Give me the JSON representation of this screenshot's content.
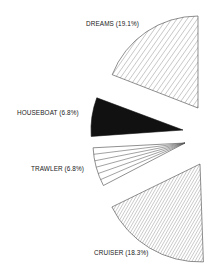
{
  "chart_data": {
    "type": "pie",
    "style": "exploded partial pie (wedges only, pulled apart)",
    "title": "",
    "slices": [
      {
        "label": "DREAMS",
        "value": 19.1,
        "display": "DREAMS (19.1%)",
        "fill": "diagonal-hatch-wide"
      },
      {
        "label": "HOUSEBOAT",
        "value": 6.8,
        "display": "HOUSEBOAT (6.8%)",
        "fill": "solid-black"
      },
      {
        "label": "TRAWLER",
        "value": 6.8,
        "display": "TRAWLER (6.8%)",
        "fill": "horizontal-lines"
      },
      {
        "label": "CRUISER",
        "value": 18.3,
        "display": "CRUISER (18.3%)",
        "fill": "diagonal-hatch-dense"
      }
    ],
    "units": "%",
    "legend": "none (inline labels)"
  },
  "colors": {
    "ink": "#1a1a1a",
    "hatch": "#555555",
    "background": "#ffffff"
  },
  "geometry": {
    "wedges": [
      {
        "name": "dreams",
        "cx": 198,
        "cy": 108,
        "r": 92,
        "start": -90,
        "end": -158.8
      },
      {
        "name": "houseboat",
        "cx": 183,
        "cy": 130,
        "r": 92,
        "start": -159.5,
        "end": -184
      },
      {
        "name": "trawler",
        "cx": 185,
        "cy": 143,
        "r": 92,
        "start": -183,
        "end": -207.5
      },
      {
        "name": "cruiser",
        "cx": 200,
        "cy": 164,
        "r": 98,
        "start": -206,
        "end": -272
      }
    ],
    "labels": [
      {
        "x": 86,
        "y": 26
      },
      {
        "x": 17,
        "y": 115
      },
      {
        "x": 31,
        "y": 171
      },
      {
        "x": 94,
        "y": 255
      }
    ]
  }
}
